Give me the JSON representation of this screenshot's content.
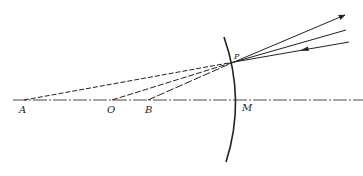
{
  "diagram": {
    "type": "concave mirror ray diagram",
    "colors": {
      "line": "#222222",
      "background": "#ffffff"
    },
    "axis": {
      "x1": 13,
      "y": 100,
      "x2": 363,
      "style": "dash-dot"
    },
    "points": {
      "A": {
        "label": "A",
        "x": 24,
        "y": 100
      },
      "O": {
        "label": "O",
        "x": 112,
        "y": 100
      },
      "B": {
        "label": "B",
        "x": 148,
        "y": 100
      },
      "M": {
        "label": "M",
        "x": 240,
        "y": 100
      },
      "P": {
        "label": "P",
        "x": 234,
        "y": 62
      }
    },
    "mirror": {
      "top": [
        224,
        37
      ],
      "bottom": [
        226,
        162
      ],
      "through": [
        "P",
        "M"
      ]
    },
    "rays": [
      {
        "name": "reflected-ray-outgoing",
        "from": "P",
        "to": [
          346,
          15
        ],
        "arrow": "end"
      },
      {
        "name": "normal-ray-extension",
        "from": "P",
        "to": [
          346,
          30
        ],
        "arrow": "none"
      },
      {
        "name": "incident-ray",
        "from": [
          349,
          42
        ],
        "to": "P",
        "arrow": "mid"
      }
    ],
    "construction_lines": [
      {
        "name": "line-A-to-P",
        "from": "A",
        "to": "P",
        "style": "dashed"
      },
      {
        "name": "line-O-to-P",
        "from": "O",
        "to": "P",
        "style": "dashed"
      },
      {
        "name": "line-B-to-P",
        "from": "B",
        "to": "P",
        "style": "dashed"
      }
    ]
  }
}
